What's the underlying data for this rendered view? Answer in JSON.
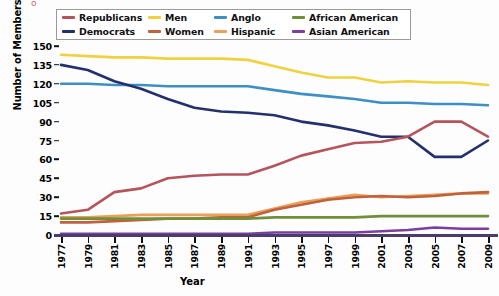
{
  "chart_data": {
    "type": "line",
    "title": "",
    "xlabel": "Year",
    "ylabel": "Number of Members",
    "grid": false,
    "legend_position": "top",
    "xlim": [
      1977,
      2009
    ],
    "ylim": [
      0,
      150
    ],
    "yticks": [
      0,
      15,
      30,
      45,
      60,
      75,
      90,
      105,
      120,
      135,
      150
    ],
    "x": [
      1977,
      1979,
      1981,
      1983,
      1985,
      1987,
      1989,
      1991,
      1993,
      1995,
      1997,
      1999,
      2001,
      2003,
      2005,
      2007,
      2009
    ],
    "xticklabels": [
      "1977",
      "1979",
      "1981",
      "1983",
      "1985",
      "1987",
      "1989",
      "1991",
      "1993",
      "1995",
      "1997",
      "1999",
      "2001",
      "2003",
      "2005",
      "2007",
      "2009"
    ],
    "series": [
      {
        "name": "Republicans",
        "color": "#b4545c",
        "values": [
          17,
          20,
          34,
          37,
          45,
          47,
          48,
          48,
          55,
          63,
          68,
          73,
          74,
          78,
          90,
          90,
          78
        ]
      },
      {
        "name": "Democrats",
        "color": "#23306e",
        "values": [
          135,
          131,
          122,
          116,
          108,
          101,
          98,
          97,
          95,
          90,
          87,
          83,
          78,
          78,
          62,
          62,
          75
        ]
      },
      {
        "name": "Men",
        "color": "#f0d13f",
        "values": [
          143,
          142,
          141,
          141,
          140,
          140,
          140,
          139,
          134,
          129,
          125,
          125,
          121,
          122,
          121,
          121,
          119
        ]
      },
      {
        "name": "Women",
        "color": "#c0603c",
        "values": [
          10,
          10,
          11,
          12,
          13,
          13,
          14,
          14,
          20,
          24,
          28,
          30,
          31,
          30,
          31,
          33,
          34
        ]
      },
      {
        "name": "Anglo",
        "color": "#3e8fc4",
        "values": [
          120,
          120,
          119,
          119,
          118,
          118,
          118,
          118,
          115,
          112,
          110,
          108,
          105,
          105,
          104,
          104,
          103
        ]
      },
      {
        "name": "Hispanic",
        "color": "#eaa05a",
        "values": [
          14,
          14,
          15,
          16,
          16,
          16,
          16,
          16,
          21,
          26,
          29,
          32,
          30,
          31,
          32,
          33,
          33
        ]
      },
      {
        "name": "African American",
        "color": "#6f8f3a",
        "values": [
          13,
          13,
          13,
          13,
          13,
          13,
          13,
          13,
          14,
          14,
          14,
          14,
          15,
          15,
          15,
          15,
          15
        ]
      },
      {
        "name": "Asian American",
        "color": "#7a3fa0",
        "values": [
          1,
          1,
          1,
          1,
          1,
          1,
          1,
          1,
          2,
          2,
          2,
          2,
          3,
          4,
          6,
          5,
          5
        ]
      }
    ]
  },
  "legend": {
    "items": [
      {
        "label": "Republicans",
        "color": "#b4545c"
      },
      {
        "label": "Men",
        "color": "#f0d13f"
      },
      {
        "label": "Anglo",
        "color": "#3e8fc4"
      },
      {
        "label": "African American",
        "color": "#6f8f3a"
      },
      {
        "label": "Democrats",
        "color": "#23306e"
      },
      {
        "label": "Women",
        "color": "#c0603c"
      },
      {
        "label": "Hispanic",
        "color": "#eaa05a"
      },
      {
        "label": "Asian American",
        "color": "#7a3fa0"
      }
    ]
  },
  "axes": {
    "y_title": "Number of Members",
    "x_title": "Year"
  }
}
